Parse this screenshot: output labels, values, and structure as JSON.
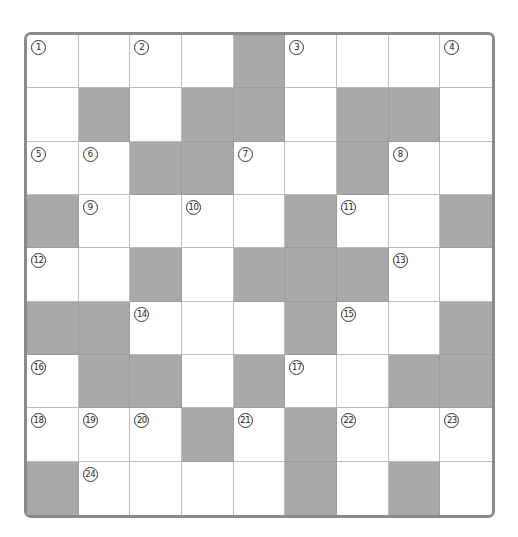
{
  "puzzle": {
    "type": "crossword",
    "rows": 9,
    "cols": 9,
    "colors": {
      "border": "#8a8a8a",
      "block": "#a9a9a9",
      "open": "#ffffff",
      "gridline": "#bdbdbd"
    },
    "layout": [
      "W W W W B W W W W",
      "W B W B B W B B W",
      "W W B B W W B W W",
      "B W W W W B W W B",
      "W W B W B B B W W",
      "B B W W W B W W B",
      "W B B W B W W B B",
      "W W W B W B W W W",
      "B W W W W B W B W"
    ],
    "cells": [
      [
        {
          "b": 0,
          "n": "1"
        },
        {
          "b": 0,
          "n": ""
        },
        {
          "b": 0,
          "n": "2"
        },
        {
          "b": 0,
          "n": ""
        },
        {
          "b": 1,
          "n": ""
        },
        {
          "b": 0,
          "n": "3"
        },
        {
          "b": 0,
          "n": ""
        },
        {
          "b": 0,
          "n": ""
        },
        {
          "b": 0,
          "n": "4"
        }
      ],
      [
        {
          "b": 0,
          "n": ""
        },
        {
          "b": 1,
          "n": ""
        },
        {
          "b": 0,
          "n": ""
        },
        {
          "b": 1,
          "n": ""
        },
        {
          "b": 1,
          "n": ""
        },
        {
          "b": 0,
          "n": ""
        },
        {
          "b": 1,
          "n": ""
        },
        {
          "b": 1,
          "n": ""
        },
        {
          "b": 0,
          "n": ""
        }
      ],
      [
        {
          "b": 0,
          "n": "5"
        },
        {
          "b": 0,
          "n": "6"
        },
        {
          "b": 1,
          "n": ""
        },
        {
          "b": 1,
          "n": ""
        },
        {
          "b": 0,
          "n": "7"
        },
        {
          "b": 0,
          "n": ""
        },
        {
          "b": 1,
          "n": ""
        },
        {
          "b": 0,
          "n": "8"
        },
        {
          "b": 0,
          "n": ""
        }
      ],
      [
        {
          "b": 1,
          "n": ""
        },
        {
          "b": 0,
          "n": "9"
        },
        {
          "b": 0,
          "n": ""
        },
        {
          "b": 0,
          "n": "10"
        },
        {
          "b": 0,
          "n": ""
        },
        {
          "b": 1,
          "n": ""
        },
        {
          "b": 0,
          "n": "11"
        },
        {
          "b": 0,
          "n": ""
        },
        {
          "b": 1,
          "n": ""
        }
      ],
      [
        {
          "b": 0,
          "n": "12"
        },
        {
          "b": 0,
          "n": ""
        },
        {
          "b": 1,
          "n": ""
        },
        {
          "b": 0,
          "n": ""
        },
        {
          "b": 1,
          "n": ""
        },
        {
          "b": 1,
          "n": ""
        },
        {
          "b": 1,
          "n": ""
        },
        {
          "b": 0,
          "n": "13"
        },
        {
          "b": 0,
          "n": ""
        }
      ],
      [
        {
          "b": 1,
          "n": ""
        },
        {
          "b": 1,
          "n": ""
        },
        {
          "b": 0,
          "n": "14"
        },
        {
          "b": 0,
          "n": ""
        },
        {
          "b": 0,
          "n": ""
        },
        {
          "b": 1,
          "n": ""
        },
        {
          "b": 0,
          "n": "15"
        },
        {
          "b": 0,
          "n": ""
        },
        {
          "b": 1,
          "n": ""
        }
      ],
      [
        {
          "b": 0,
          "n": "16"
        },
        {
          "b": 1,
          "n": ""
        },
        {
          "b": 1,
          "n": ""
        },
        {
          "b": 0,
          "n": ""
        },
        {
          "b": 1,
          "n": ""
        },
        {
          "b": 0,
          "n": "17"
        },
        {
          "b": 0,
          "n": ""
        },
        {
          "b": 1,
          "n": ""
        },
        {
          "b": 1,
          "n": ""
        }
      ],
      [
        {
          "b": 0,
          "n": "18"
        },
        {
          "b": 0,
          "n": "19"
        },
        {
          "b": 0,
          "n": "20"
        },
        {
          "b": 1,
          "n": ""
        },
        {
          "b": 0,
          "n": "21"
        },
        {
          "b": 1,
          "n": ""
        },
        {
          "b": 0,
          "n": "22"
        },
        {
          "b": 0,
          "n": ""
        },
        {
          "b": 0,
          "n": "23"
        }
      ],
      [
        {
          "b": 1,
          "n": ""
        },
        {
          "b": 0,
          "n": "24"
        },
        {
          "b": 0,
          "n": ""
        },
        {
          "b": 0,
          "n": ""
        },
        {
          "b": 0,
          "n": ""
        },
        {
          "b": 1,
          "n": ""
        },
        {
          "b": 0,
          "n": ""
        },
        {
          "b": 1,
          "n": ""
        },
        {
          "b": 0,
          "n": ""
        }
      ]
    ]
  }
}
